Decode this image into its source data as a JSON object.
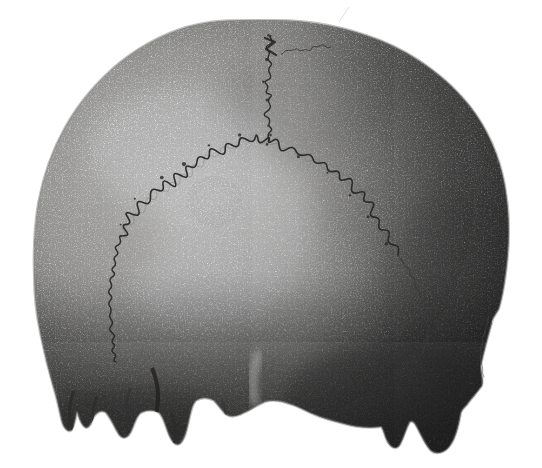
{
  "figure": {
    "background_color": "#ffffff",
    "ink_color": "#1c1c1c",
    "suture_ink": "#262626",
    "suture_echo_ink": "#6a6a6a",
    "bone_light": "#f5f4f2",
    "bone_mid": "#c9c8c6",
    "bone_shadow": "#8e8d8b",
    "crevice_ink": "#2e2c2a",
    "highlight": "#ffffff"
  }
}
